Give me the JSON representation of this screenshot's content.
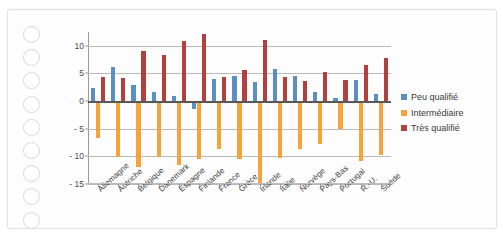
{
  "top_cropped_text": "",
  "chart_data": {
    "type": "bar",
    "title": "",
    "subtitle": "",
    "xlabel": "",
    "ylabel": "",
    "ylim": [
      -15,
      12.5
    ],
    "yticks": [
      10,
      5,
      0,
      -5,
      -10,
      -15
    ],
    "ytick_labels": [
      "10",
      "5",
      "0",
      "- 5",
      "- 10",
      "- 15"
    ],
    "grid": true,
    "legend_position": "right",
    "categories": [
      "Allemagne",
      "Autriche",
      "Belgique",
      "Danemark",
      "Espagne",
      "Finlande",
      "France",
      "Grèce",
      "Irlande",
      "Italie",
      "Norvège",
      "Pays-Bas",
      "Portugal",
      "R.-U.",
      "Suède"
    ],
    "series": [
      {
        "name": "Peu qualifié",
        "color": "#5B8FC4",
        "values": [
          2.3,
          6.2,
          3.0,
          1.7,
          0.9,
          -1.5,
          4.0,
          4.6,
          3.5,
          5.8,
          4.6,
          1.7,
          0.5,
          3.9,
          1.2
        ]
      },
      {
        "name": "Intermédiaire",
        "color": "#F7A23B",
        "values": [
          -6.7,
          -10.2,
          -11.9,
          -10.2,
          -11.6,
          -10.5,
          -8.7,
          -10.4,
          -14.8,
          -10.3,
          -8.6,
          -7.7,
          -5.1,
          -10.9,
          -9.7
        ]
      },
      {
        "name": "Très qualifié",
        "color": "#B1413E",
        "values": [
          4.3,
          4.1,
          9.1,
          8.4,
          10.8,
          12.1,
          4.3,
          5.7,
          11.0,
          4.4,
          3.6,
          5.3,
          3.9,
          6.5,
          7.8
        ]
      }
    ]
  },
  "legend": {
    "items": [
      {
        "label": "Peu qualifié",
        "color": "#5B8FC4"
      },
      {
        "label": "Intermédiaire",
        "color": "#F7A23B"
      },
      {
        "label": "Très qualifié",
        "color": "#B1413E"
      }
    ]
  }
}
